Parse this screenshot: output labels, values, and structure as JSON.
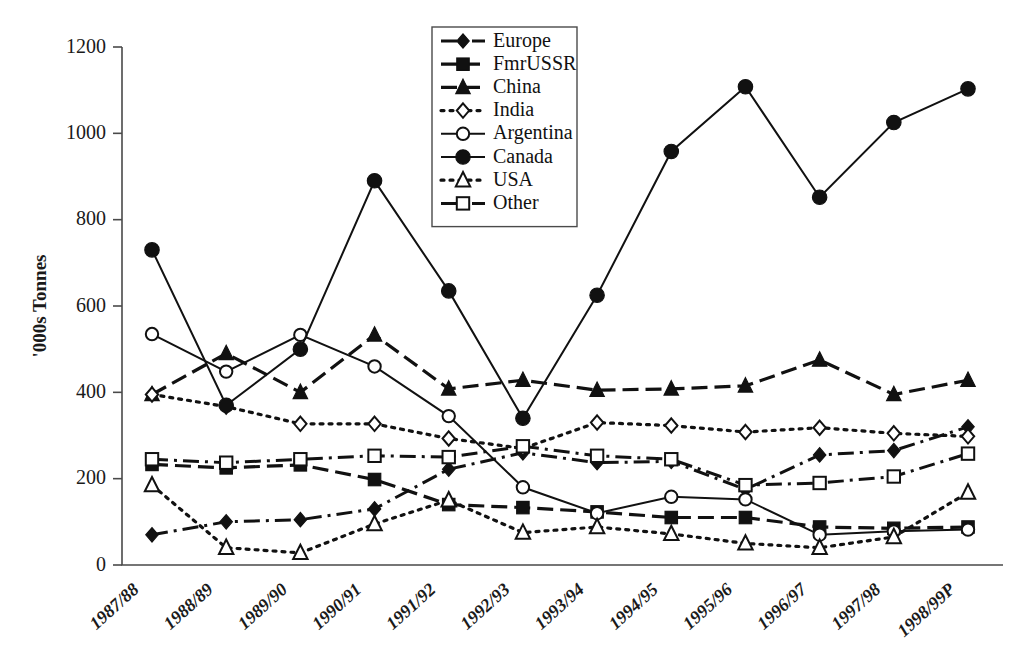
{
  "chart_data": {
    "type": "line",
    "title": "",
    "xlabel": "",
    "ylabel": "'000s Tonnes",
    "ylim": [
      0,
      1200
    ],
    "ytick_step": 200,
    "yticks": [
      "0",
      "200",
      "400",
      "600",
      "800",
      "1000",
      "1200"
    ],
    "grid": false,
    "legend_position": "top-center",
    "categories": [
      "1987/88",
      "1988/89",
      "1989/90",
      "1990/91",
      "1991/92",
      "1992/93",
      "1993/94",
      "1994/95",
      "1995/96",
      "1996/97",
      "1997/98",
      "1998/99P"
    ],
    "series": [
      {
        "name": "Europe",
        "marker": "filled-diamond",
        "dash": "dashdot",
        "values": [
          70,
          100,
          105,
          130,
          222,
          260,
          237,
          240,
          175,
          255,
          265,
          320
        ]
      },
      {
        "name": "FmrUSSR",
        "marker": "filled-square",
        "dash": "dashed",
        "values": [
          233,
          225,
          232,
          198,
          140,
          133,
          123,
          110,
          110,
          88,
          85,
          88
        ]
      },
      {
        "name": "China",
        "marker": "filled-triangle",
        "dash": "dashed",
        "values": [
          395,
          490,
          400,
          533,
          408,
          428,
          405,
          408,
          415,
          475,
          395,
          428
        ]
      },
      {
        "name": "India",
        "marker": "open-diamond",
        "dash": "dotted",
        "values": [
          395,
          367,
          327,
          327,
          293,
          270,
          330,
          323,
          308,
          318,
          305,
          298
        ]
      },
      {
        "name": "Argentina",
        "marker": "open-circle",
        "dash": "solid",
        "values": [
          535,
          448,
          533,
          460,
          345,
          180,
          120,
          158,
          152,
          70,
          78,
          82
        ]
      },
      {
        "name": "Canada",
        "marker": "filled-circle",
        "dash": "solid",
        "values": [
          730,
          370,
          500,
          890,
          635,
          340,
          625,
          958,
          1108,
          852,
          1025,
          1103
        ]
      },
      {
        "name": "USA",
        "marker": "open-triangle",
        "dash": "dotted",
        "values": [
          185,
          40,
          28,
          95,
          150,
          75,
          88,
          72,
          50,
          40,
          65,
          168
        ]
      },
      {
        "name": "Other",
        "marker": "open-square",
        "dash": "dashdot",
        "values": [
          245,
          237,
          245,
          253,
          250,
          275,
          253,
          245,
          185,
          190,
          205,
          258
        ]
      }
    ]
  },
  "colors": {
    "ink": "#111111",
    "axis": "#4a4a4a",
    "background": "#ffffff"
  }
}
